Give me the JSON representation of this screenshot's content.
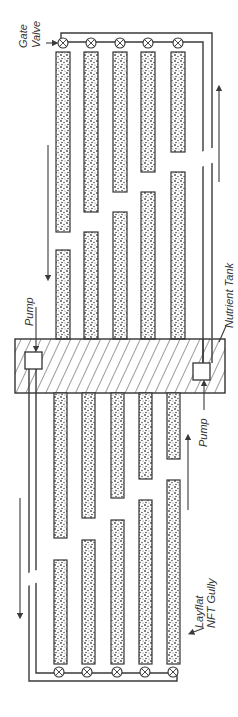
{
  "diagram": {
    "labels": {
      "gate_valve_line1": "Gate",
      "gate_valve_line2": "Valve",
      "pump_left": "Pump",
      "pump_right": "Pump",
      "nutrient_tank": "Nutrient Tank",
      "gully_line1": "Layflat",
      "gully_line2": "NFT Gully"
    },
    "components": {
      "gullies_per_side": 5,
      "gate_valves_per_side": 5,
      "pumps": 2,
      "tank": 1
    },
    "colors": {
      "line": "#3a3a3a",
      "gully_fill": "#8a8a8a",
      "background": "#ffffff"
    }
  }
}
